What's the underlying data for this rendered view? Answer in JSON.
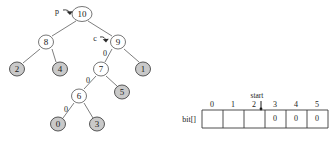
{
  "figure": {
    "tree": {
      "pointers": [
        {
          "id": "p",
          "label": "p",
          "target_node": "10"
        },
        {
          "id": "c",
          "label": "c",
          "target_node": "9"
        }
      ],
      "nodes": [
        {
          "id": "n10",
          "label": "10",
          "fill": "open",
          "cx": 82,
          "cy": 14
        },
        {
          "id": "n8",
          "label": "8",
          "fill": "open",
          "cx": 46,
          "cy": 42
        },
        {
          "id": "n9",
          "label": "9",
          "fill": "open",
          "cx": 118,
          "cy": 42
        },
        {
          "id": "n2",
          "label": "2",
          "fill": "filled",
          "cx": 17,
          "cy": 69
        },
        {
          "id": "n4",
          "label": "4",
          "fill": "filled",
          "cx": 60,
          "cy": 69
        },
        {
          "id": "n7",
          "label": "7",
          "fill": "open",
          "cx": 101,
          "cy": 69
        },
        {
          "id": "n1",
          "label": "1",
          "fill": "filled",
          "cx": 143,
          "cy": 69
        },
        {
          "id": "n6",
          "label": "6",
          "fill": "open",
          "cx": 79,
          "cy": 96
        },
        {
          "id": "n5",
          "label": "5",
          "fill": "filled",
          "cx": 122,
          "cy": 92
        },
        {
          "id": "n0",
          "label": "0",
          "fill": "filled",
          "cx": 58,
          "cy": 124
        },
        {
          "id": "n3",
          "label": "3",
          "fill": "filled",
          "cx": 97,
          "cy": 124
        }
      ],
      "edges": [
        {
          "from": "n10",
          "to": "n8",
          "label": ""
        },
        {
          "from": "n10",
          "to": "n9",
          "label": ""
        },
        {
          "from": "n8",
          "to": "n2",
          "label": ""
        },
        {
          "from": "n8",
          "to": "n4",
          "label": ""
        },
        {
          "from": "n9",
          "to": "n7",
          "label": "0"
        },
        {
          "from": "n9",
          "to": "n1",
          "label": ""
        },
        {
          "from": "n7",
          "to": "n6",
          "label": "0"
        },
        {
          "from": "n7",
          "to": "n5",
          "label": ""
        },
        {
          "from": "n6",
          "to": "n0",
          "label": "0"
        },
        {
          "from": "n6",
          "to": "n3",
          "label": ""
        }
      ],
      "edge_label_positions": [
        {
          "for": "n9-n7",
          "label": "0",
          "x": 105,
          "y": 54
        },
        {
          "for": "n7-n6",
          "label": "0",
          "x": 88,
          "y": 81
        },
        {
          "for": "n6-n0",
          "label": "0",
          "x": 66,
          "y": 110
        }
      ]
    },
    "array": {
      "name": "bit[]",
      "indices": [
        "0",
        "1",
        "2",
        "3",
        "4",
        "5"
      ],
      "values": [
        "",
        "",
        "",
        "0",
        "0",
        "0"
      ],
      "start_label": "start",
      "start_index": 2
    }
  }
}
